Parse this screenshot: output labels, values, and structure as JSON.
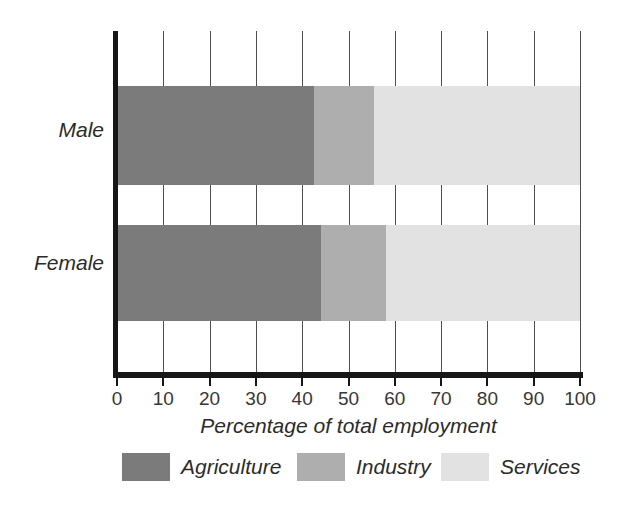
{
  "figure": {
    "x_axis_title": "Percentage of total employment"
  },
  "chart_data": {
    "type": "bar",
    "orientation": "horizontal",
    "stacked": true,
    "categories": [
      "Male",
      "Female"
    ],
    "series": [
      {
        "name": "Agriculture",
        "color": "#7b7b7b",
        "values": [
          42.5,
          44
        ]
      },
      {
        "name": "Industry",
        "color": "#aeaeae",
        "values": [
          13,
          14
        ]
      },
      {
        "name": "Services",
        "color": "#e2e2e2",
        "values": [
          44.5,
          42
        ]
      }
    ],
    "xlabel": "Percentage of total employment",
    "xlim": [
      0,
      100
    ],
    "xticks": [
      0,
      10,
      20,
      30,
      40,
      50,
      60,
      70,
      80,
      90,
      100
    ],
    "grid": "vertical",
    "legend_position": "bottom",
    "axis_color": "#161616",
    "gridline_color": "#4f4f4f"
  }
}
